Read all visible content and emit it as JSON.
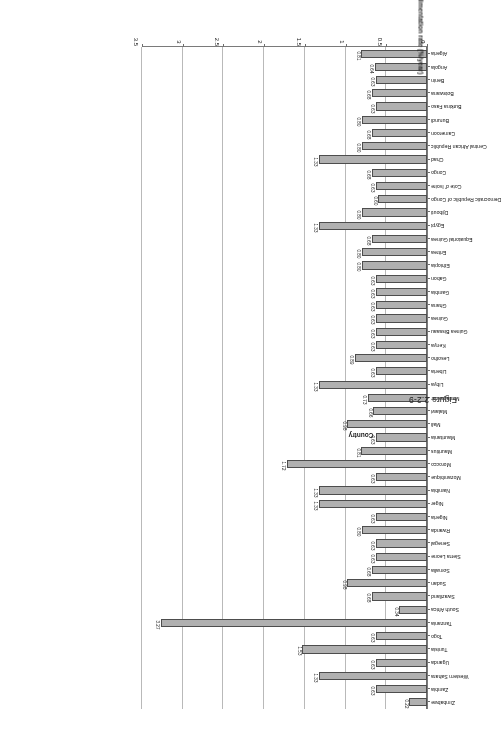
{
  "figure": {
    "caption": "Figure 2.2-9",
    "axis_title_category": "Country",
    "axis_title_value": "Sedimentation rate (%/year)"
  },
  "chart_data": {
    "type": "bar",
    "orientation": "horizontal",
    "title": "",
    "xlabel": "Sedimentation rate (%/year)",
    "ylabel": "Country",
    "xlim": [
      0,
      3.5
    ],
    "xticks": [
      "0",
      "0.5",
      "1",
      "1.5",
      "2",
      "2.5",
      "3",
      "3.5"
    ],
    "xtick_values": [
      0,
      0.5,
      1,
      1.5,
      2,
      2.5,
      3,
      3.5
    ],
    "grid": true,
    "legend": "none",
    "bar_color": "#b0b0b0",
    "bar_edge_color": "#4d4d4d",
    "rotated_180": true,
    "categories": [
      "Algeria",
      "Angola",
      "Benin",
      "Botswana",
      "Burkina Faso",
      "Burundi",
      "Cameroon",
      "Central African Republic",
      "Chad",
      "Congo",
      "Cote d' Ivoire",
      "Democratic Republic of Congo",
      "Djibouti",
      "Egypt",
      "Equatorial Guinea",
      "Eritrea",
      "Ethiopia",
      "Gabon",
      "Gambia",
      "Ghana",
      "Guinea",
      "Guinea Bissaau",
      "Kenya",
      "Lesotho",
      "Liberia",
      "Libya",
      "Madagascar",
      "Malawi",
      "Mali",
      "Mauritania",
      "Mauritius",
      "Morocco",
      "Mozambique",
      "Namibia",
      "Niger",
      "Nigeria",
      "Rwanda",
      "Senegal",
      "Sierra Leone",
      "Somalia",
      "Sudan",
      "Swaziland",
      "South Africa",
      "Tanzania",
      "Togo",
      "Tunisia",
      "Uganda",
      "Western Sahara",
      "Zambia",
      "Zimbabwe"
    ],
    "values": [
      0.81,
      0.64,
      0.63,
      0.68,
      0.63,
      0.8,
      0.68,
      0.8,
      1.33,
      0.68,
      0.63,
      0.6,
      0.8,
      1.33,
      0.68,
      0.8,
      0.8,
      0.63,
      0.63,
      0.63,
      0.63,
      0.63,
      0.63,
      0.89,
      0.63,
      1.33,
      0.73,
      0.66,
      0.98,
      0.63,
      0.81,
      1.72,
      0.63,
      1.33,
      1.33,
      0.63,
      0.8,
      0.63,
      0.63,
      0.68,
      0.98,
      0.68,
      0.34,
      3.27,
      0.63,
      1.53,
      0.63,
      1.33,
      0.63,
      0.22
    ],
    "value_labels": [
      "0.81",
      "0.64",
      "0.63",
      "0.68",
      "0.63",
      "0.80",
      "0.68",
      "0.80",
      "1.33",
      "0.68",
      "0.63",
      "0.60",
      "0.80",
      "1.33",
      "0.68",
      "0.80",
      "0.80",
      "0.63",
      "0.63",
      "0.63",
      "0.63",
      "0.63",
      "0.63",
      "0.89",
      "0.63",
      "1.33",
      "0.73",
      "0.66",
      "0.98",
      "0.63",
      "0.81",
      "1.72",
      "0.63",
      "1.33",
      "1.33",
      "0.63",
      "0.80",
      "0.63",
      "0.63",
      "0.68",
      "0.98",
      "0.68",
      "0.34",
      "3.27",
      "0.63",
      "1.53",
      "0.63",
      "1.33",
      "0.63",
      "0.22"
    ]
  }
}
